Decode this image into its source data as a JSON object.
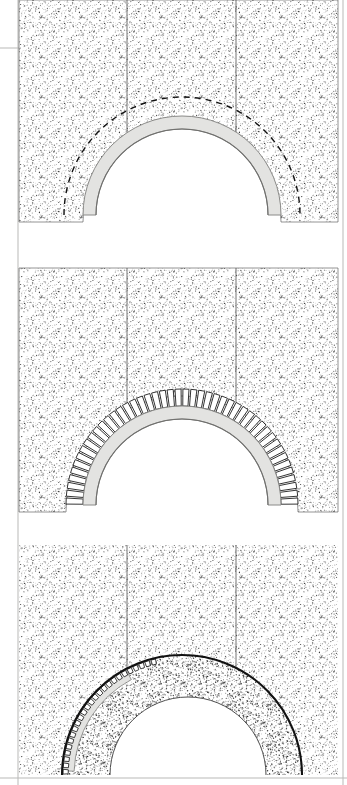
{
  "figure": {
    "type": "technical-line-drawing",
    "width": 347,
    "height": 785,
    "background_color": "#ffffff",
    "ink_color": "#111111",
    "stipple_color": "#222222",
    "ring_fill_color": "#e3e3e1",
    "ring_edge_color": "#8a8a88",
    "fill_hatch_color": "#1a1a1a",
    "frame": {
      "left_rule_x": 18,
      "right_rule_x": 343,
      "top_tick_y": 48,
      "bottom_rule_y": 778,
      "rule_color": "#b9b9b7",
      "rule_width": 1
    },
    "panels": [
      {
        "id": "panel-1",
        "name": "centering-erected",
        "stage_number": 1,
        "description": "Wall with semicircular centering ring in place; dashed line marks intended extrados of the arch.",
        "wall": {
          "x": 19,
          "y": 0,
          "width": 319,
          "height": 222
        },
        "arch": {
          "center_x": 182,
          "center_y": 215,
          "intrados_radius": 86,
          "ring_thickness": 13
        },
        "dashed_arc": {
          "center_x": 182,
          "center_y": 215,
          "radius": 118,
          "dash": "6 5"
        },
        "joints_x": [
          127,
          236
        ],
        "has_voussoirs": false,
        "has_fill": false
      },
      {
        "id": "panel-2",
        "name": "voussoirs-set",
        "stage_number": 2,
        "description": "Radial wedge-shaped voussoir blocks laid on the centering around the full semicircle.",
        "wall": {
          "x": 19,
          "y": 268,
          "width": 319,
          "height": 244
        },
        "arch": {
          "center_x": 182,
          "center_y": 505,
          "intrados_radius": 86,
          "ring_thickness": 13
        },
        "voussoirs": {
          "count": 46,
          "depth": 17,
          "gap_degrees": 0.9
        },
        "joints_x": [
          127,
          236
        ],
        "has_voussoirs": true,
        "has_fill": false
      },
      {
        "id": "panel-3",
        "name": "backfill-and-haunching",
        "stage_number": 3,
        "description": "Completed arch line with stippled rubble backfill packed over the haunches; residual centering shown at left.",
        "wall": {
          "x": 19,
          "y": 545,
          "width": 319,
          "height": 230
        },
        "arch": {
          "center_x": 182,
          "center_y": 775,
          "intrados_radius": 120,
          "ring_thickness": 12
        },
        "inner_soffit": {
          "center_x": 188,
          "center_y": 778,
          "radius": 78
        },
        "joints_x": [
          127,
          236
        ],
        "has_voussoirs": true,
        "has_fill": true
      }
    ],
    "legend_keys": [
      {
        "key": "stipple",
        "label": "masonry / rubble (stippled)"
      },
      {
        "key": "gray-band",
        "label": "centering ring"
      },
      {
        "key": "dashed",
        "label": "projected extrados"
      },
      {
        "key": "voussoir",
        "label": "voussoir block"
      }
    ]
  }
}
